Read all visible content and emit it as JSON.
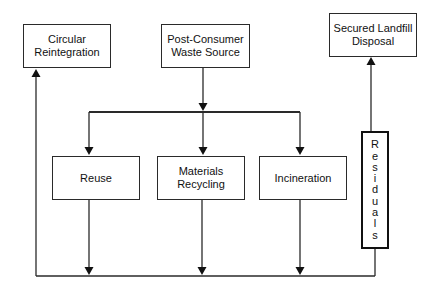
{
  "diagram": {
    "type": "flowchart",
    "nodes": {
      "circular": {
        "lines": [
          "Circular",
          "Reintegration"
        ]
      },
      "source": {
        "lines": [
          "Post-Consumer",
          "Waste Source"
        ]
      },
      "landfill": {
        "lines": [
          "Secured Landfill",
          "Disposal"
        ]
      },
      "reuse": {
        "lines": [
          "Reuse"
        ]
      },
      "recycling": {
        "lines": [
          "Materials",
          "Recycling"
        ]
      },
      "incineration": {
        "lines": [
          "Incineration"
        ]
      },
      "residuals": {
        "label": "Residuals",
        "letters": [
          "R",
          "e",
          "s",
          "i",
          "d",
          "u",
          "a",
          "l",
          "s"
        ]
      }
    },
    "edges": [
      {
        "from": "Post-Consumer Waste Source",
        "to": "Reuse"
      },
      {
        "from": "Post-Consumer Waste Source",
        "to": "Materials Recycling"
      },
      {
        "from": "Post-Consumer Waste Source",
        "to": "Incineration"
      },
      {
        "from": "Reuse",
        "to": "Circular Reintegration"
      },
      {
        "from": "Materials Recycling",
        "to": "Circular Reintegration"
      },
      {
        "from": "Incineration",
        "to": "Circular Reintegration"
      },
      {
        "from": "Residuals",
        "to": "Circular Reintegration"
      },
      {
        "from": "Residuals",
        "to": "Secured Landfill Disposal"
      }
    ],
    "colors": {
      "line": "#2a2a2a",
      "background": "#ffffff"
    }
  }
}
